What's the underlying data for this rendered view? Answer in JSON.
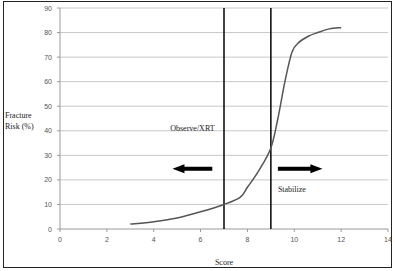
{
  "chart_data": {
    "type": "line",
    "title": "",
    "xlabel": "Score",
    "ylabel": "Fracture Risk (%)",
    "ylabel_lines": [
      "Fracture",
      "Risk (%)"
    ],
    "xlim": [
      0,
      14
    ],
    "ylim": [
      0,
      90
    ],
    "x_ticks": [
      0,
      2,
      4,
      6,
      8,
      10,
      12,
      14
    ],
    "y_ticks": [
      0,
      10,
      20,
      30,
      40,
      50,
      60,
      70,
      80,
      90
    ],
    "grid": "horizontal",
    "legend": "none",
    "series": [
      {
        "name": "Fracture Risk",
        "x": [
          3,
          4,
          5,
          6,
          7,
          7.7,
          8,
          8.5,
          9,
          9.3,
          9.6,
          9.9,
          10.2,
          10.6,
          11,
          11.5,
          12
        ],
        "y": [
          2,
          3,
          4.5,
          7,
          10,
          13,
          17,
          24,
          33,
          45,
          60,
          72,
          76,
          78.5,
          80,
          81.5,
          82
        ]
      }
    ],
    "vertical_lines": [
      7,
      9
    ],
    "annotations": [
      {
        "text": "Observe/XRT",
        "x": 6.6,
        "y": 40,
        "arrow": "left",
        "arrow_from": 6.5,
        "arrow_to": 4.8,
        "arrow_y": 24.5
      },
      {
        "text": "Stabilize",
        "x": 9.3,
        "y": 15,
        "arrow": "right",
        "arrow_from": 9.3,
        "arrow_to": 11.2,
        "arrow_y": 24.5
      }
    ]
  }
}
